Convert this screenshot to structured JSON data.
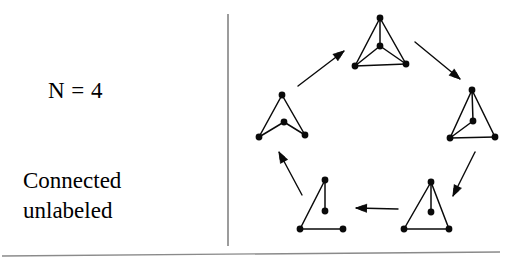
{
  "figure": {
    "name": "graph-isomorphism-cycle-figure",
    "background_color": "#ffffff",
    "ink_color": "#0a0a0a",
    "rule_color": "#8a8a8a"
  },
  "caption": {
    "node_count_label": "N = 4",
    "line1": "Connected",
    "line2": "unlabeled"
  },
  "dividers": {
    "vertical": {
      "x": 228,
      "y1": 14,
      "y2": 246,
      "color": "#5a5a5a"
    },
    "bottom": {
      "x1": 2,
      "y1": 256,
      "x2": 500,
      "y2": 252,
      "color": "#8a8a8a"
    }
  },
  "graphs": [
    {
      "id": "graph-k4",
      "name": "complete-graph-k4",
      "position": "top",
      "edge_count": 6,
      "nodes": [
        {
          "id": "a",
          "x": 380,
          "y": 18
        },
        {
          "id": "b",
          "x": 380,
          "y": 46
        },
        {
          "id": "c",
          "x": 355,
          "y": 66
        },
        {
          "id": "d",
          "x": 406,
          "y": 64
        }
      ],
      "edges": [
        [
          "a",
          "b"
        ],
        [
          "a",
          "c"
        ],
        [
          "a",
          "d"
        ],
        [
          "b",
          "c"
        ],
        [
          "b",
          "d"
        ],
        [
          "c",
          "d"
        ]
      ]
    },
    {
      "id": "graph-diamond",
      "name": "k4-minus-edge-diamond",
      "position": "right",
      "edge_count": 5,
      "nodes": [
        {
          "id": "a",
          "x": 472,
          "y": 90
        },
        {
          "id": "b",
          "x": 473,
          "y": 121
        },
        {
          "id": "c",
          "x": 450,
          "y": 138
        },
        {
          "id": "d",
          "x": 495,
          "y": 137
        }
      ],
      "edges": [
        [
          "a",
          "b"
        ],
        [
          "a",
          "c"
        ],
        [
          "a",
          "d"
        ],
        [
          "b",
          "c"
        ],
        [
          "c",
          "d"
        ]
      ]
    },
    {
      "id": "graph-paw",
      "name": "triangle-with-pendant",
      "position": "bottom-right",
      "edge_count": 4,
      "nodes": [
        {
          "id": "a",
          "x": 431,
          "y": 182
        },
        {
          "id": "b",
          "x": 431,
          "y": 212
        },
        {
          "id": "c",
          "x": 404,
          "y": 229
        },
        {
          "id": "d",
          "x": 449,
          "y": 229
        }
      ],
      "edges": [
        [
          "a",
          "b"
        ],
        [
          "a",
          "c"
        ],
        [
          "a",
          "d"
        ],
        [
          "c",
          "d"
        ]
      ]
    },
    {
      "id": "graph-path",
      "name": "path-tree-four-vertices",
      "position": "bottom-left",
      "edge_count": 3,
      "nodes": [
        {
          "id": "a",
          "x": 325,
          "y": 180
        },
        {
          "id": "b",
          "x": 325,
          "y": 211
        },
        {
          "id": "c",
          "x": 300,
          "y": 229
        },
        {
          "id": "d",
          "x": 343,
          "y": 229
        }
      ],
      "edges": [
        [
          "a",
          "b"
        ],
        [
          "a",
          "c"
        ],
        [
          "c",
          "d"
        ]
      ]
    },
    {
      "id": "graph-c4",
      "name": "four-cycle",
      "position": "left",
      "edge_count": 4,
      "nodes": [
        {
          "id": "a",
          "x": 282,
          "y": 95
        },
        {
          "id": "b",
          "x": 284,
          "y": 122
        },
        {
          "id": "c",
          "x": 259,
          "y": 137
        },
        {
          "id": "d",
          "x": 305,
          "y": 135
        }
      ],
      "edges": [
        [
          "a",
          "c"
        ],
        [
          "a",
          "d"
        ],
        [
          "b",
          "c"
        ],
        [
          "b",
          "d"
        ]
      ]
    }
  ],
  "arrows": [
    {
      "id": "arrow-c4-to-k4",
      "name": "arrow-up-right",
      "from": "graph-c4",
      "to": "graph-k4",
      "x1": 298,
      "y1": 86,
      "x2": 344,
      "y2": 51,
      "direction": "up-right"
    },
    {
      "id": "arrow-k4-to-diamond",
      "name": "arrow-down-right",
      "from": "graph-k4",
      "to": "graph-diamond",
      "x1": 415,
      "y1": 42,
      "x2": 460,
      "y2": 79,
      "direction": "down-right"
    },
    {
      "id": "arrow-diamond-to-paw",
      "name": "arrow-down-left",
      "from": "graph-diamond",
      "to": "graph-paw",
      "x1": 475,
      "y1": 152,
      "x2": 453,
      "y2": 196,
      "direction": "down-left"
    },
    {
      "id": "arrow-paw-to-path",
      "name": "arrow-left",
      "from": "graph-paw",
      "to": "graph-path",
      "x1": 398,
      "y1": 209,
      "x2": 356,
      "y2": 208,
      "direction": "left"
    },
    {
      "id": "arrow-path-to-c4",
      "name": "arrow-up-left",
      "from": "graph-path",
      "to": "graph-c4",
      "x1": 302,
      "y1": 195,
      "x2": 279,
      "y2": 152,
      "direction": "up-left"
    }
  ]
}
